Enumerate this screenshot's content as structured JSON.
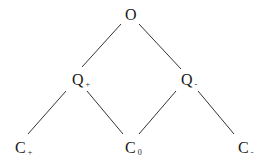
{
  "diagram": {
    "type": "lattice",
    "nodes": [
      {
        "id": "O",
        "label": "O",
        "sub": "",
        "x": 125,
        "y": 8
      },
      {
        "id": "Qp",
        "label": "Q",
        "sub": "+",
        "x": 72,
        "y": 72
      },
      {
        "id": "Qm",
        "label": "Q",
        "sub": "-",
        "x": 181,
        "y": 72
      },
      {
        "id": "Cp",
        "label": "C",
        "sub": "+",
        "x": 15,
        "y": 140
      },
      {
        "id": "C0",
        "label": "C",
        "sub": "0",
        "x": 125,
        "y": 140
      },
      {
        "id": "Cm",
        "label": "C",
        "sub": "-",
        "x": 238,
        "y": 140
      }
    ],
    "edges": [
      {
        "from": "O",
        "to": "Qp",
        "x1": 121,
        "y1": 24,
        "x2": 82,
        "y2": 67
      },
      {
        "from": "O",
        "to": "Qm",
        "x1": 139,
        "y1": 24,
        "x2": 181,
        "y2": 69
      },
      {
        "from": "Qp",
        "to": "Cp",
        "x1": 66,
        "y1": 91,
        "x2": 28,
        "y2": 134
      },
      {
        "from": "Qp",
        "to": "C0",
        "x1": 87,
        "y1": 91,
        "x2": 123,
        "y2": 134
      },
      {
        "from": "Qm",
        "to": "C0",
        "x1": 176,
        "y1": 91,
        "x2": 139,
        "y2": 134
      },
      {
        "from": "Qm",
        "to": "Cm",
        "x1": 198,
        "y1": 91,
        "x2": 234,
        "y2": 134
      }
    ],
    "line_color": "#333333"
  }
}
